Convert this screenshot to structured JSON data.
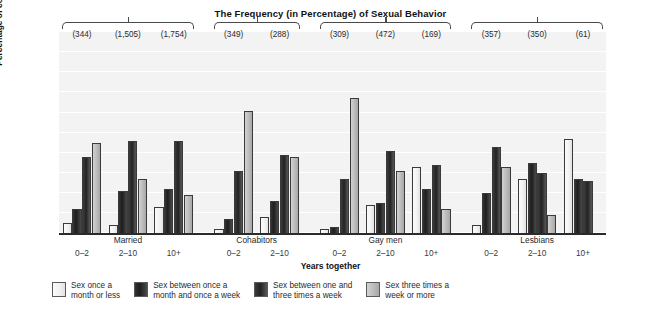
{
  "chart_data": {
    "type": "bar",
    "title": "The Frequency (in Percentage) of Sexual Behavior",
    "xlabel": "Years together",
    "ylabel": "Percentage of couples",
    "ylim": [
      0,
      100
    ],
    "yticks": [
      100,
      90,
      80,
      70,
      60,
      50,
      40,
      30,
      20,
      10,
      0
    ],
    "grid": true,
    "legend_position": "bottom",
    "series": [
      {
        "name": "Sex once a\nmonth or less",
        "color": "#f2f2f2"
      },
      {
        "name": "Sex between once a\nmonth and once a week",
        "color": "#1e1e1e"
      },
      {
        "name": "Sex between one and\nthree times a week",
        "color": "#232323"
      },
      {
        "name": "Sex three times a\nweek or more",
        "color": "#bdbdbd"
      }
    ],
    "groups": [
      {
        "label": "Married",
        "subgroups": [
          {
            "x": "0–2",
            "n": "(344)",
            "values": [
              5,
              12,
              38,
              45
            ]
          },
          {
            "x": "2–10",
            "n": "(1,505)",
            "values": [
              4,
              21,
              46,
              27
            ]
          },
          {
            "x": "10+",
            "n": "(1,754)",
            "values": [
              13,
              22,
              46,
              19
            ]
          }
        ]
      },
      {
        "label": "Cohabitors",
        "subgroups": [
          {
            "x": "0–2",
            "n": "(349)",
            "values": [
              2,
              7,
              31,
              61
            ]
          },
          {
            "x": "2–10",
            "n": "(288)",
            "values": [
              8,
              16,
              39,
              38
            ]
          }
        ]
      },
      {
        "label": "Gay men",
        "subgroups": [
          {
            "x": "0–2",
            "n": "(309)",
            "values": [
              2,
              3,
              27,
              67
            ]
          },
          {
            "x": "2–10",
            "n": "(472)",
            "values": [
              14,
              15,
              41,
              31
            ]
          },
          {
            "x": "10+",
            "n": "(169)",
            "values": [
              33,
              22,
              34,
              12
            ]
          }
        ]
      },
      {
        "label": "Lesbians",
        "subgroups": [
          {
            "x": "0–2",
            "n": "(357)",
            "values": [
              4,
              20,
              43,
              33
            ]
          },
          {
            "x": "2–10",
            "n": "(350)",
            "values": [
              27,
              35,
              30,
              9
            ]
          },
          {
            "x": "10+",
            "n": "(61)",
            "values": [
              47,
              27,
              26,
              0
            ]
          }
        ]
      }
    ]
  }
}
